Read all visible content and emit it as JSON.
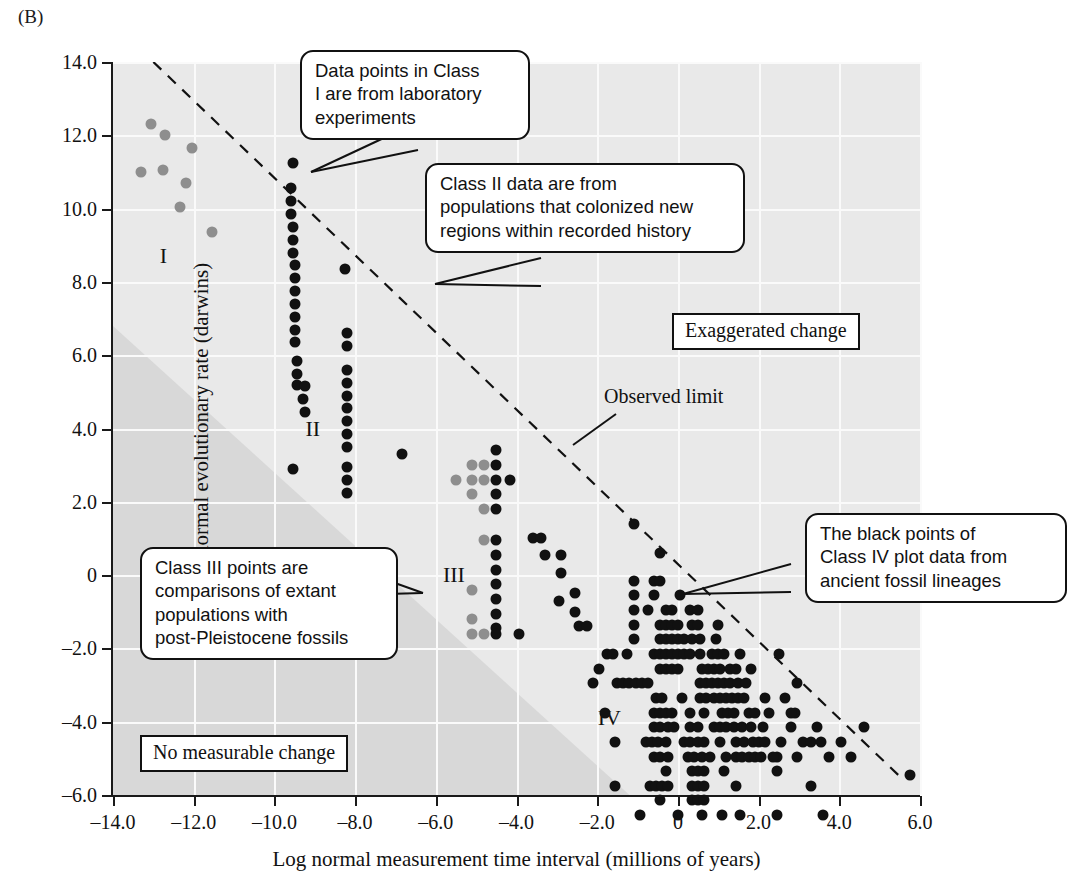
{
  "panel_letter": "(B)",
  "chart_data": {
    "type": "scatter",
    "title": "",
    "xlabel": "Log normal measurement time interval (millions of years)",
    "ylabel": "Log normal evolutionary rate (darwins)",
    "xlim": [
      -14.0,
      6.0
    ],
    "ylim": [
      -6.0,
      14.0
    ],
    "xticks": [
      -14.0,
      -12.0,
      -10.0,
      -8.0,
      -6.0,
      -4.0,
      -2.0,
      0,
      2.0,
      4.0,
      6.0
    ],
    "xtick_labels": [
      "–14.0",
      "–12.0",
      "–10.0",
      "–8.0",
      "–6.0",
      "–4.0",
      "–2.0",
      "0",
      "2.0",
      "4.0",
      "6.0"
    ],
    "yticks": [
      -6.0,
      -4.0,
      -2.0,
      0,
      2.0,
      4.0,
      6.0,
      8.0,
      10.0,
      12.0,
      14.0
    ],
    "ytick_labels": [
      "–6.0",
      "–4.0",
      "–2.0",
      "0",
      "2.0",
      "4.0",
      "6.0",
      "8.0",
      "10.0",
      "12.0",
      "14.0"
    ],
    "grid": true,
    "legend": "none",
    "colors": {
      "class_i_points": "#8e8e8e",
      "class_ii_points": "#111111",
      "class_iii_gray_points": "#8e8e8e",
      "class_iii_black_points": "#111111",
      "class_iv_points": "#111111",
      "plot_background": "#e9e9e9",
      "shaded_band": "#d8d8d8",
      "gridlines": "#fafafa",
      "axis": "#111111"
    },
    "series": [
      {
        "name": "Class I",
        "color": "#8e8e8e",
        "points": [
          [
            -13.05,
            12.3
          ],
          [
            -12.7,
            12.0
          ],
          [
            -13.3,
            11.0
          ],
          [
            -12.75,
            11.05
          ],
          [
            -12.05,
            11.65
          ],
          [
            -12.2,
            10.7
          ],
          [
            -12.35,
            10.05
          ],
          [
            -11.55,
            9.35
          ]
        ]
      },
      {
        "name": "Class II",
        "color": "#111111",
        "points": [
          [
            -9.55,
            11.25
          ],
          [
            -9.6,
            10.55
          ],
          [
            -9.6,
            10.2
          ],
          [
            -9.6,
            9.85
          ],
          [
            -9.55,
            9.5
          ],
          [
            -9.55,
            9.15
          ],
          [
            -9.55,
            8.8
          ],
          [
            -9.5,
            8.45
          ],
          [
            -9.5,
            8.1
          ],
          [
            -9.5,
            7.75
          ],
          [
            -9.5,
            7.4
          ],
          [
            -9.5,
            7.05
          ],
          [
            -9.5,
            6.7
          ],
          [
            -9.5,
            6.35
          ],
          [
            -9.45,
            5.85
          ],
          [
            -9.45,
            5.5
          ],
          [
            -9.45,
            5.2
          ],
          [
            -9.25,
            5.15
          ],
          [
            -9.3,
            4.8
          ],
          [
            -9.25,
            4.45
          ],
          [
            -9.55,
            2.9
          ],
          [
            -8.25,
            8.35
          ],
          [
            -8.2,
            6.6
          ],
          [
            -8.2,
            6.25
          ],
          [
            -8.2,
            5.6
          ],
          [
            -8.2,
            5.25
          ],
          [
            -8.2,
            4.9
          ],
          [
            -8.2,
            4.55
          ],
          [
            -8.2,
            4.2
          ],
          [
            -8.2,
            3.85
          ],
          [
            -8.2,
            3.5
          ],
          [
            -8.2,
            2.95
          ],
          [
            -8.2,
            2.6
          ],
          [
            -8.2,
            2.25
          ]
        ]
      },
      {
        "name": "Class III gray",
        "color": "#8e8e8e",
        "points": [
          [
            -5.5,
            2.6
          ],
          [
            -5.1,
            3.0
          ],
          [
            -5.1,
            2.6
          ],
          [
            -5.1,
            2.2
          ],
          [
            -4.8,
            3.0
          ],
          [
            -4.8,
            2.6
          ],
          [
            -4.8,
            1.8
          ],
          [
            -4.8,
            0.95
          ],
          [
            -5.1,
            -0.4
          ],
          [
            -5.1,
            -1.2
          ],
          [
            -5.1,
            -1.6
          ],
          [
            -4.8,
            -1.6
          ]
        ]
      },
      {
        "name": "Class III black",
        "color": "#111111",
        "points": [
          [
            -4.5,
            3.4
          ],
          [
            -4.5,
            3.0
          ],
          [
            -4.5,
            2.6
          ],
          [
            -4.5,
            2.2
          ],
          [
            -4.5,
            1.8
          ],
          [
            -4.5,
            0.95
          ],
          [
            -4.5,
            0.55
          ],
          [
            -4.5,
            0.15
          ],
          [
            -4.5,
            -0.25
          ],
          [
            -4.5,
            -0.65
          ],
          [
            -4.5,
            -1.05
          ],
          [
            -4.5,
            -1.45
          ],
          [
            -4.5,
            -1.6
          ],
          [
            -4.15,
            2.6
          ],
          [
            -3.6,
            1.0
          ],
          [
            -3.4,
            1.0
          ],
          [
            -3.3,
            0.55
          ],
          [
            -2.9,
            0.55
          ],
          [
            -2.9,
            0.05
          ],
          [
            -2.95,
            -0.7
          ],
          [
            -2.55,
            -0.5
          ],
          [
            -2.55,
            -1.0
          ],
          [
            -2.45,
            -1.4
          ],
          [
            -2.25,
            -1.4
          ],
          [
            -3.95,
            -1.6
          ],
          [
            -6.85,
            3.3
          ]
        ]
      },
      {
        "name": "Class IV",
        "color": "#111111",
        "points": [
          [
            -1.1,
            1.4
          ],
          [
            -0.45,
            0.6
          ],
          [
            -1.1,
            -0.15
          ],
          [
            -0.6,
            -0.15
          ],
          [
            -0.45,
            -0.15
          ],
          [
            -1.1,
            -0.55
          ],
          [
            -0.6,
            -0.55
          ],
          [
            0.05,
            -0.55
          ],
          [
            -1.1,
            -0.95
          ],
          [
            -0.75,
            -0.95
          ],
          [
            -0.3,
            -0.95
          ],
          [
            -0.15,
            -0.95
          ],
          [
            0.3,
            -0.95
          ],
          [
            0.5,
            -0.95
          ],
          [
            -1.1,
            -1.35
          ],
          [
            -0.45,
            -1.35
          ],
          [
            -0.3,
            -1.35
          ],
          [
            -0.15,
            -1.35
          ],
          [
            0.0,
            -1.35
          ],
          [
            0.35,
            -1.35
          ],
          [
            0.5,
            -1.35
          ],
          [
            1.0,
            -1.35
          ],
          [
            -1.1,
            -1.75
          ],
          [
            -0.45,
            -1.75
          ],
          [
            -0.3,
            -1.75
          ],
          [
            -0.15,
            -1.75
          ],
          [
            0.0,
            -1.75
          ],
          [
            0.15,
            -1.75
          ],
          [
            0.35,
            -1.75
          ],
          [
            0.55,
            -1.75
          ],
          [
            0.95,
            -1.75
          ],
          [
            -1.75,
            -2.15
          ],
          [
            -1.6,
            -2.15
          ],
          [
            -1.25,
            -2.15
          ],
          [
            -0.6,
            -2.15
          ],
          [
            -0.45,
            -2.15
          ],
          [
            -0.3,
            -2.15
          ],
          [
            -0.15,
            -2.15
          ],
          [
            0.0,
            -2.15
          ],
          [
            0.15,
            -2.15
          ],
          [
            0.3,
            -2.15
          ],
          [
            0.55,
            -2.15
          ],
          [
            0.85,
            -2.15
          ],
          [
            1.0,
            -2.15
          ],
          [
            1.15,
            -2.15
          ],
          [
            1.55,
            -2.15
          ],
          [
            -1.95,
            -2.55
          ],
          [
            -0.45,
            -2.55
          ],
          [
            -0.3,
            -2.55
          ],
          [
            -0.15,
            -2.55
          ],
          [
            0.0,
            -2.55
          ],
          [
            0.6,
            -2.55
          ],
          [
            0.75,
            -2.55
          ],
          [
            0.9,
            -2.55
          ],
          [
            1.05,
            -2.55
          ],
          [
            1.3,
            -2.55
          ],
          [
            1.45,
            -2.55
          ],
          [
            1.8,
            -2.55
          ],
          [
            -2.1,
            -2.95
          ],
          [
            -1.5,
            -2.95
          ],
          [
            -1.35,
            -2.95
          ],
          [
            -1.2,
            -2.95
          ],
          [
            -1.05,
            -2.95
          ],
          [
            -0.9,
            -2.95
          ],
          [
            -0.75,
            -2.95
          ],
          [
            0.55,
            -2.95
          ],
          [
            0.7,
            -2.95
          ],
          [
            0.85,
            -2.95
          ],
          [
            1.0,
            -2.95
          ],
          [
            1.15,
            -2.95
          ],
          [
            1.3,
            -2.95
          ],
          [
            1.5,
            -2.95
          ],
          [
            1.7,
            -2.95
          ],
          [
            -0.55,
            -3.35
          ],
          [
            -0.4,
            -3.35
          ],
          [
            0.1,
            -3.35
          ],
          [
            0.55,
            -3.35
          ],
          [
            0.7,
            -3.35
          ],
          [
            0.9,
            -3.35
          ],
          [
            1.05,
            -3.35
          ],
          [
            1.2,
            -3.35
          ],
          [
            1.35,
            -3.35
          ],
          [
            1.5,
            -3.35
          ],
          [
            1.65,
            -3.35
          ],
          [
            2.15,
            -3.35
          ],
          [
            -1.8,
            -3.75
          ],
          [
            -0.6,
            -3.75
          ],
          [
            -0.45,
            -3.75
          ],
          [
            -0.3,
            -3.75
          ],
          [
            -0.15,
            -3.75
          ],
          [
            0.3,
            -3.75
          ],
          [
            0.65,
            -3.75
          ],
          [
            1.1,
            -3.75
          ],
          [
            1.25,
            -3.75
          ],
          [
            1.4,
            -3.75
          ],
          [
            1.75,
            -3.75
          ],
          [
            1.9,
            -3.75
          ],
          [
            2.25,
            -3.75
          ],
          [
            -0.6,
            -4.15
          ],
          [
            -0.45,
            -4.15
          ],
          [
            -0.25,
            -4.15
          ],
          [
            -0.1,
            -4.15
          ],
          [
            0.3,
            -4.15
          ],
          [
            0.5,
            -4.15
          ],
          [
            0.9,
            -4.15
          ],
          [
            1.05,
            -4.15
          ],
          [
            1.2,
            -4.15
          ],
          [
            1.4,
            -4.15
          ],
          [
            1.6,
            -4.15
          ],
          [
            1.8,
            -4.15
          ],
          [
            2.1,
            -4.15
          ],
          [
            -1.55,
            -4.55
          ],
          [
            -0.8,
            -4.55
          ],
          [
            -0.65,
            -4.55
          ],
          [
            -0.5,
            -4.55
          ],
          [
            -0.3,
            -4.55
          ],
          [
            0.15,
            -4.55
          ],
          [
            0.3,
            -4.55
          ],
          [
            0.5,
            -4.55
          ],
          [
            0.65,
            -4.55
          ],
          [
            1.05,
            -4.55
          ],
          [
            1.45,
            -4.55
          ],
          [
            1.65,
            -4.55
          ],
          [
            1.85,
            -4.55
          ],
          [
            2.0,
            -4.55
          ],
          [
            2.15,
            -4.55
          ],
          [
            2.55,
            -4.55
          ],
          [
            -0.6,
            -4.95
          ],
          [
            -0.45,
            -4.95
          ],
          [
            -0.25,
            -4.95
          ],
          [
            0.25,
            -4.95
          ],
          [
            0.4,
            -4.95
          ],
          [
            0.6,
            -4.95
          ],
          [
            0.8,
            -4.95
          ],
          [
            1.2,
            -4.95
          ],
          [
            1.45,
            -4.95
          ],
          [
            1.6,
            -4.95
          ],
          [
            1.75,
            -4.95
          ],
          [
            1.9,
            -4.95
          ],
          [
            2.05,
            -4.95
          ],
          [
            2.45,
            -4.95
          ],
          [
            2.95,
            -4.95
          ],
          [
            -0.3,
            -5.35
          ],
          [
            0.35,
            -5.35
          ],
          [
            0.5,
            -5.35
          ],
          [
            0.65,
            -5.35
          ],
          [
            1.15,
            -5.35
          ],
          [
            2.45,
            -5.35
          ],
          [
            -1.55,
            -5.75
          ],
          [
            -0.7,
            -5.75
          ],
          [
            -0.55,
            -5.75
          ],
          [
            -0.4,
            -5.75
          ],
          [
            -0.25,
            -5.75
          ],
          [
            0.35,
            -5.75
          ],
          [
            0.5,
            -5.75
          ],
          [
            0.65,
            -5.75
          ],
          [
            1.45,
            -5.75
          ],
          [
            3.3,
            -5.75
          ],
          [
            -0.45,
            -6.15
          ],
          [
            0.35,
            -6.15
          ],
          [
            0.5,
            -6.15
          ],
          [
            0.65,
            -6.15
          ],
          [
            -0.95,
            -6.55
          ],
          [
            0.0,
            -6.55
          ],
          [
            0.6,
            -6.55
          ],
          [
            1.1,
            -6.55
          ],
          [
            1.55,
            -6.55
          ],
          [
            2.45,
            -6.55
          ],
          [
            3.6,
            -6.55
          ],
          [
            2.35,
            -4.95
          ],
          [
            2.8,
            -4.15
          ],
          [
            3.1,
            -4.55
          ],
          [
            3.3,
            -4.55
          ],
          [
            2.9,
            -3.75
          ],
          [
            3.45,
            -4.15
          ],
          [
            3.55,
            -4.55
          ],
          [
            3.75,
            -4.95
          ],
          [
            4.05,
            -4.55
          ],
          [
            4.3,
            -4.95
          ],
          [
            4.6,
            -4.15
          ],
          [
            5.75,
            -5.45
          ],
          [
            2.65,
            -3.35
          ],
          [
            2.95,
            -2.95
          ],
          [
            2.5,
            -2.15
          ],
          [
            2.8,
            -3.75
          ]
        ]
      }
    ],
    "observed_limit_line": {
      "label": "Observed limit",
      "style": "dashed",
      "from": [
        -13.0,
        14.0
      ],
      "to": [
        5.6,
        -5.6
      ]
    },
    "annotations": [
      {
        "name": "class-i-label",
        "text": "I",
        "x": -12.75,
        "y": 8.7
      },
      {
        "name": "class-ii-label",
        "text": "II",
        "x": -9.05,
        "y": 4.0
      },
      {
        "name": "class-iii-label",
        "text": "III",
        "x": -5.55,
        "y": 0.0
      },
      {
        "name": "class-iv-label",
        "text": "IV",
        "x": -1.7,
        "y": -3.9
      }
    ]
  },
  "callouts": [
    {
      "name": "callout-class-i",
      "text": "Data points in Class\nI are from laboratory\nexperiments"
    },
    {
      "name": "callout-class-ii",
      "text": "Class II data are from\npopulations that colonized new\nregions within recorded history"
    },
    {
      "name": "callout-class-iii",
      "text": "Class III points are\ncomparisons of extant\npopulations with\npost-Pleistocene fossils"
    },
    {
      "name": "callout-class-iv",
      "text": "The black points of\nClass IV plot data from\nancient fossil lineages"
    }
  ],
  "zone_labels": {
    "exaggerated_change": "Exaggerated change",
    "no_measurable_change": "No measurable change",
    "observed_limit": "Observed limit"
  }
}
